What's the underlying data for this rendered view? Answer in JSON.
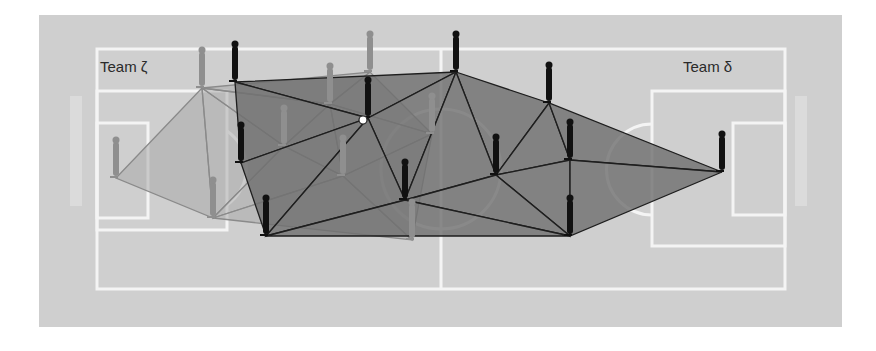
{
  "figure": {
    "colors": {
      "background_outer": "#ffffff",
      "pitch": "#cfcfcf",
      "pitch_lines": "#f4f4f4",
      "team_zeta_fill": "#a9a9a9",
      "team_zeta_edge": "#8a8a8a",
      "team_zeta_player": "#8f8f8f",
      "team_delta_fill": "#6e6e6e",
      "team_delta_edge": "#1e1e1e",
      "team_delta_player": "#111111"
    }
  },
  "labels": {
    "team_zeta": "Team ζ",
    "team_delta": "Team δ"
  },
  "teams": {
    "zeta": {
      "name": "Team ζ",
      "players": [
        {
          "id": "z1",
          "x": 116,
          "y": 178
        },
        {
          "id": "z2",
          "x": 202,
          "y": 88
        },
        {
          "id": "z3",
          "x": 213,
          "y": 218
        },
        {
          "id": "z4",
          "x": 284,
          "y": 146
        },
        {
          "id": "z5",
          "x": 330,
          "y": 104
        },
        {
          "id": "z6",
          "x": 370,
          "y": 72
        },
        {
          "id": "z7",
          "x": 343,
          "y": 176
        },
        {
          "id": "z8",
          "x": 432,
          "y": 134
        },
        {
          "id": "z9",
          "x": 412,
          "y": 240
        }
      ]
    },
    "delta": {
      "name": "Team δ",
      "players": [
        {
          "id": "d1",
          "x": 235,
          "y": 82
        },
        {
          "id": "d2",
          "x": 456,
          "y": 72
        },
        {
          "id": "d3",
          "x": 549,
          "y": 103
        },
        {
          "id": "d4",
          "x": 368,
          "y": 118
        },
        {
          "id": "d5",
          "x": 241,
          "y": 163
        },
        {
          "id": "d6",
          "x": 496,
          "y": 175
        },
        {
          "id": "d7",
          "x": 570,
          "y": 160
        },
        {
          "id": "d8",
          "x": 405,
          "y": 200
        },
        {
          "id": "d9",
          "x": 266,
          "y": 236
        },
        {
          "id": "d10",
          "x": 570,
          "y": 236
        },
        {
          "id": "d11",
          "x": 722,
          "y": 172
        }
      ]
    }
  }
}
